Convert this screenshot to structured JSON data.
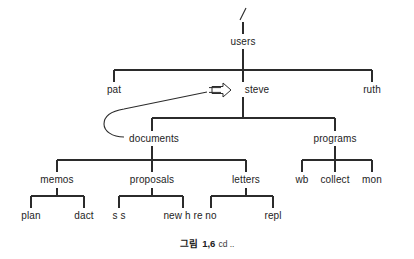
{
  "diagram": {
    "title_caption": {
      "figure_word": "그림",
      "number": "1,6",
      "trailing": "cd .."
    },
    "line_color": "#2b2b2b",
    "text_color": "#1d1d1d",
    "background": "#ffffff",
    "nodes": {
      "root": "/",
      "users": "users",
      "pat": "pat",
      "steve": "steve",
      "ruth": "ruth",
      "documents": "documents",
      "programs": "programs",
      "memos": "memos",
      "proposals": "proposals",
      "letters": "letters",
      "wb": "wb",
      "collect": "collect",
      "mon": "mon",
      "plan": "plan",
      "dact": "dact",
      "ss": "s s",
      "newhire": "new h re",
      "no": "no",
      "repl": "repl"
    },
    "annotation": {
      "pointer_symbol": "arrow-right-outline",
      "pointer_target": "steve",
      "pointer_source": "documents"
    }
  }
}
